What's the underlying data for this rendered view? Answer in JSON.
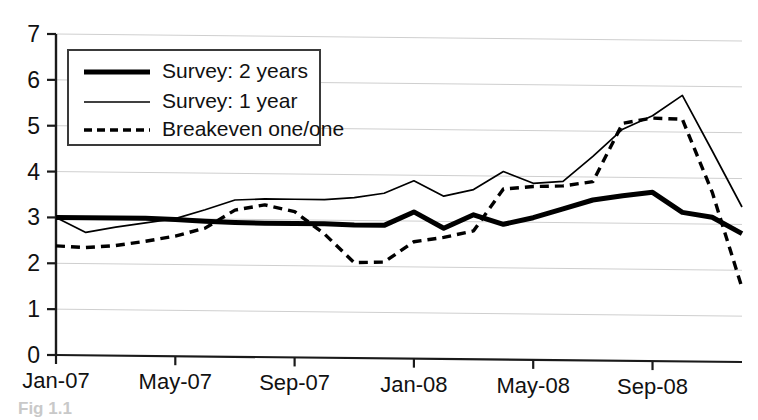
{
  "figure": {
    "background_color": "#ffffff",
    "caption_fragment": "Fig 1.1",
    "axis_color": "#1a1a1a",
    "gridline_color": "#cfcfcf"
  },
  "axes": {
    "y_ticks": [
      "0",
      "1",
      "2",
      "3",
      "4",
      "5",
      "6",
      "7"
    ],
    "x_ticks": [
      "Jan-07",
      "May-07",
      "Sep-07",
      "Jan-08",
      "May-08",
      "Sep-08"
    ]
  },
  "legend": {
    "entries": [
      {
        "label": "Survey: 2 years",
        "style": "thick-solid",
        "color": "#000000"
      },
      {
        "label": "Survey: 1 year",
        "style": "thin-solid",
        "color": "#000000"
      },
      {
        "label": "Breakeven one/one",
        "style": "dashed",
        "color": "#000000"
      }
    ]
  },
  "chart_data": {
    "type": "line",
    "title": "",
    "xlabel": "",
    "ylabel": "",
    "ylim": [
      0,
      7
    ],
    "grid": true,
    "legend_position": "upper-left",
    "x": [
      "Jan-07",
      "Feb-07",
      "Mar-07",
      "Apr-07",
      "May-07",
      "Jun-07",
      "Jul-07",
      "Aug-07",
      "Sep-07",
      "Oct-07",
      "Nov-07",
      "Dec-07",
      "Jan-08",
      "Feb-08",
      "Mar-08",
      "Apr-08",
      "May-08",
      "Jun-08",
      "Jul-08",
      "Aug-08",
      "Sep-08",
      "Oct-08",
      "Nov-08",
      "Dec-08"
    ],
    "categories": [
      "Jan-07",
      "Feb-07",
      "Mar-07",
      "Apr-07",
      "May-07",
      "Jun-07",
      "Jul-07",
      "Aug-07",
      "Sep-07",
      "Oct-07",
      "Nov-07",
      "Dec-07",
      "Jan-08",
      "Feb-08",
      "Mar-08",
      "Apr-08",
      "May-08",
      "Jun-08",
      "Jul-08",
      "Aug-08",
      "Sep-08",
      "Oct-08",
      "Nov-08",
      "Dec-08"
    ],
    "series": [
      {
        "name": "Survey: 2 years",
        "style": "thick-solid",
        "values": [
          3.0,
          3.0,
          3.0,
          3.0,
          2.98,
          2.95,
          2.93,
          2.92,
          2.92,
          2.92,
          2.9,
          2.9,
          3.2,
          2.85,
          3.15,
          2.95,
          3.1,
          3.3,
          3.5,
          3.6,
          3.68,
          3.25,
          3.15,
          2.8
        ]
      },
      {
        "name": "Survey: 1 year",
        "style": "thin-solid",
        "values": [
          3.0,
          2.68,
          2.8,
          2.9,
          3.0,
          3.2,
          3.42,
          3.45,
          3.45,
          3.45,
          3.5,
          3.6,
          3.88,
          3.55,
          3.7,
          4.1,
          3.85,
          3.9,
          4.45,
          5.05,
          5.35,
          5.8,
          4.6,
          3.38
        ]
      },
      {
        "name": "Breakeven one/one",
        "style": "dashed",
        "values": [
          2.38,
          2.35,
          2.4,
          2.5,
          2.62,
          2.8,
          3.2,
          3.32,
          3.18,
          2.7,
          2.08,
          2.1,
          2.55,
          2.65,
          2.8,
          3.72,
          3.78,
          3.8,
          3.9,
          5.18,
          5.3,
          5.28,
          3.7,
          1.62
        ]
      }
    ]
  }
}
